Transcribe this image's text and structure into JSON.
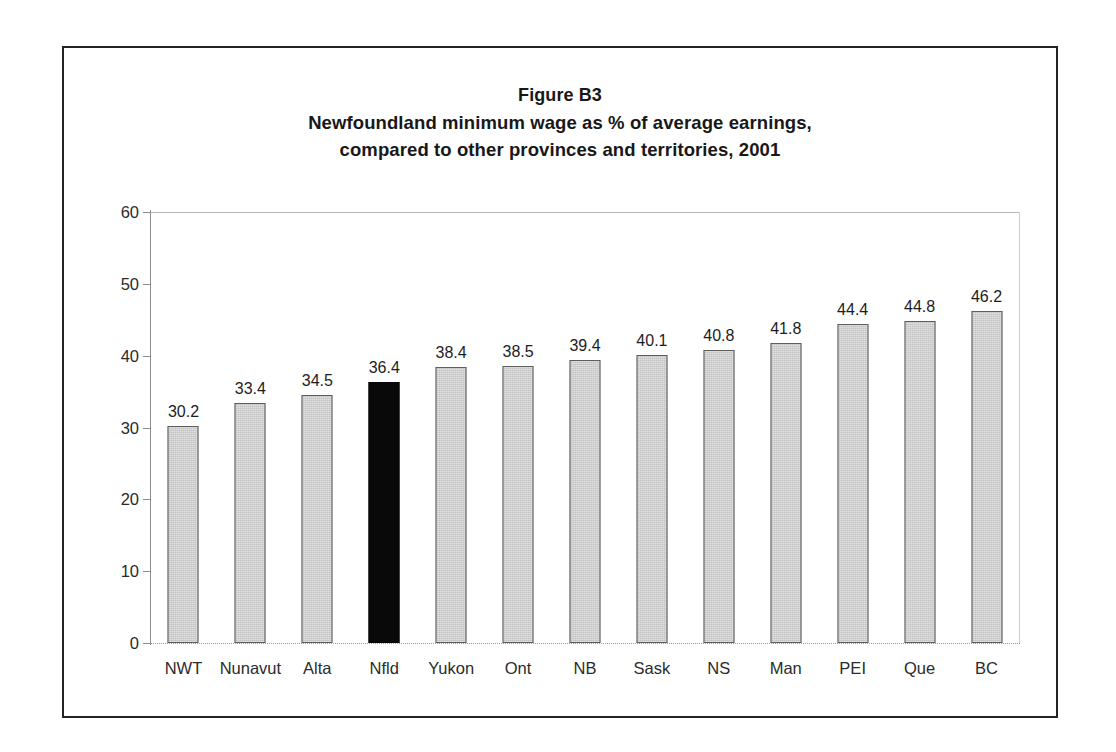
{
  "figure": {
    "title_lines": [
      "Figure B3",
      "Newfoundland minimum wage as % of average earnings,",
      "compared to other provinces and territories, 2001"
    ]
  },
  "colors": {
    "bar_fill": "#c3c3c3",
    "bar_border": "#5d5d5d",
    "highlight_fill": "#090909",
    "frame": "#242424",
    "axis": "#8d8d8d",
    "text": "#1d1d1d"
  },
  "chart_data": {
    "type": "bar",
    "xlabel": "",
    "ylabel": "",
    "ylim": [
      0,
      60
    ],
    "yticks": [
      0,
      10,
      20,
      30,
      40,
      50,
      60
    ],
    "ytick_labels": [
      "0",
      "10",
      "20",
      "30",
      "40",
      "50",
      "60"
    ],
    "grid": false,
    "legend": false,
    "highlight_category": "Nfld",
    "categories": [
      "NWT",
      "Nunavut",
      "Alta",
      "Nfld",
      "Yukon",
      "Ont",
      "NB",
      "Sask",
      "NS",
      "Man",
      "PEI",
      "Que",
      "BC"
    ],
    "values": [
      30.2,
      33.4,
      34.5,
      36.4,
      38.4,
      38.5,
      39.4,
      40.1,
      40.8,
      41.8,
      44.4,
      44.8,
      46.2
    ],
    "value_labels": [
      "30.2",
      "33.4",
      "34.5",
      "36.4",
      "38.4",
      "38.5",
      "39.4",
      "40.1",
      "40.8",
      "41.8",
      "44.4",
      "44.8",
      "46.2"
    ]
  }
}
